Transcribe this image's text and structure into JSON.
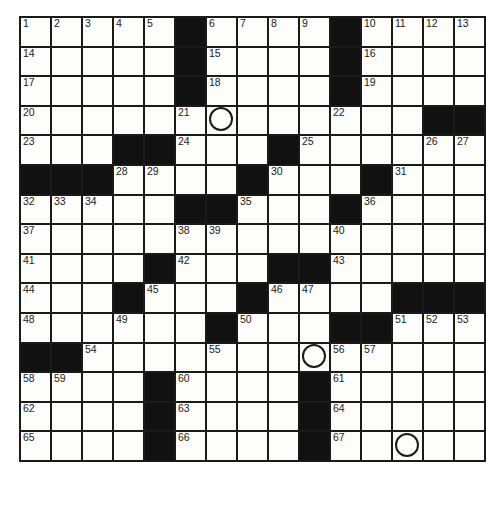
{
  "puzzle": {
    "title": "Crossword Puzzle Grid",
    "columns": 15,
    "rows": 16,
    "colors": {
      "block": "#111111",
      "cell": "#fdfdfb",
      "grid_line": "#1a1a1a",
      "number": "#1a1a1a",
      "circle": "#1a1a1a"
    },
    "legend": {
      "block_label": "blocked square",
      "circle_label": "circled square",
      "open_label": "open square"
    },
    "clue_numbers_present": [
      1,
      2,
      3,
      4,
      5,
      6,
      7,
      8,
      9,
      10,
      11,
      12,
      13,
      14,
      15,
      16,
      17,
      18,
      19,
      20,
      21,
      22,
      23,
      24,
      25,
      26,
      27,
      28,
      29,
      30,
      31,
      32,
      33,
      34,
      35,
      36,
      37,
      38,
      39,
      40,
      41,
      42,
      43,
      44,
      45,
      46,
      47,
      48,
      49,
      50,
      51,
      52,
      53,
      54,
      55,
      56,
      57,
      58,
      59,
      60,
      61,
      62,
      63,
      64,
      65,
      66,
      67
    ],
    "circled_cells": [
      {
        "row": 3,
        "col": 6
      },
      {
        "row": 12,
        "col": 9
      },
      {
        "row": 15,
        "col": 13
      }
    ],
    "grid": [
      [
        {
          "block": false,
          "num": "1"
        },
        {
          "block": false,
          "num": "2"
        },
        {
          "block": false,
          "num": "3"
        },
        {
          "block": false,
          "num": "4"
        },
        {
          "block": false,
          "num": "5"
        },
        {
          "block": true,
          "num": ""
        },
        {
          "block": false,
          "num": "6"
        },
        {
          "block": false,
          "num": "7"
        },
        {
          "block": false,
          "num": "8"
        },
        {
          "block": false,
          "num": "9"
        },
        {
          "block": true,
          "num": ""
        },
        {
          "block": false,
          "num": "10"
        },
        {
          "block": false,
          "num": "11"
        },
        {
          "block": false,
          "num": "12"
        },
        {
          "block": false,
          "num": "13"
        }
      ],
      [
        {
          "block": false,
          "num": "14"
        },
        {
          "block": false,
          "num": ""
        },
        {
          "block": false,
          "num": ""
        },
        {
          "block": false,
          "num": ""
        },
        {
          "block": false,
          "num": ""
        },
        {
          "block": true,
          "num": ""
        },
        {
          "block": false,
          "num": "15"
        },
        {
          "block": false,
          "num": ""
        },
        {
          "block": false,
          "num": ""
        },
        {
          "block": false,
          "num": ""
        },
        {
          "block": true,
          "num": ""
        },
        {
          "block": false,
          "num": "16"
        },
        {
          "block": false,
          "num": ""
        },
        {
          "block": false,
          "num": ""
        },
        {
          "block": false,
          "num": ""
        }
      ],
      [
        {
          "block": false,
          "num": "17"
        },
        {
          "block": false,
          "num": ""
        },
        {
          "block": false,
          "num": ""
        },
        {
          "block": false,
          "num": ""
        },
        {
          "block": false,
          "num": ""
        },
        {
          "block": true,
          "num": ""
        },
        {
          "block": false,
          "num": "18"
        },
        {
          "block": false,
          "num": ""
        },
        {
          "block": false,
          "num": ""
        },
        {
          "block": false,
          "num": ""
        },
        {
          "block": true,
          "num": ""
        },
        {
          "block": false,
          "num": "19"
        },
        {
          "block": false,
          "num": ""
        },
        {
          "block": false,
          "num": ""
        },
        {
          "block": false,
          "num": ""
        }
      ],
      [
        {
          "block": false,
          "num": "20"
        },
        {
          "block": false,
          "num": ""
        },
        {
          "block": false,
          "num": ""
        },
        {
          "block": false,
          "num": ""
        },
        {
          "block": false,
          "num": ""
        },
        {
          "block": false,
          "num": "21"
        },
        {
          "block": false,
          "num": "",
          "circle": true
        },
        {
          "block": false,
          "num": ""
        },
        {
          "block": false,
          "num": ""
        },
        {
          "block": false,
          "num": ""
        },
        {
          "block": false,
          "num": "22"
        },
        {
          "block": false,
          "num": ""
        },
        {
          "block": false,
          "num": ""
        },
        {
          "block": true,
          "num": ""
        },
        {
          "block": true,
          "num": ""
        }
      ],
      [
        {
          "block": false,
          "num": "23"
        },
        {
          "block": false,
          "num": ""
        },
        {
          "block": false,
          "num": ""
        },
        {
          "block": true,
          "num": ""
        },
        {
          "block": true,
          "num": ""
        },
        {
          "block": false,
          "num": "24"
        },
        {
          "block": false,
          "num": ""
        },
        {
          "block": false,
          "num": ""
        },
        {
          "block": true,
          "num": ""
        },
        {
          "block": false,
          "num": "25"
        },
        {
          "block": false,
          "num": ""
        },
        {
          "block": false,
          "num": ""
        },
        {
          "block": false,
          "num": ""
        },
        {
          "block": false,
          "num": "26"
        },
        {
          "block": false,
          "num": "27"
        }
      ],
      [
        {
          "block": true,
          "num": ""
        },
        {
          "block": true,
          "num": ""
        },
        {
          "block": true,
          "num": ""
        },
        {
          "block": false,
          "num": "28"
        },
        {
          "block": false,
          "num": "29"
        },
        {
          "block": false,
          "num": ""
        },
        {
          "block": false,
          "num": ""
        },
        {
          "block": true,
          "num": ""
        },
        {
          "block": false,
          "num": "30"
        },
        {
          "block": false,
          "num": ""
        },
        {
          "block": false,
          "num": ""
        },
        {
          "block": true,
          "num": ""
        },
        {
          "block": false,
          "num": "31"
        },
        {
          "block": false,
          "num": ""
        },
        {
          "block": false,
          "num": ""
        }
      ],
      [
        {
          "block": false,
          "num": "32"
        },
        {
          "block": false,
          "num": "33"
        },
        {
          "block": false,
          "num": "34"
        },
        {
          "block": false,
          "num": ""
        },
        {
          "block": false,
          "num": ""
        },
        {
          "block": true,
          "num": ""
        },
        {
          "block": true,
          "num": ""
        },
        {
          "block": false,
          "num": "35"
        },
        {
          "block": false,
          "num": ""
        },
        {
          "block": false,
          "num": ""
        },
        {
          "block": true,
          "num": ""
        },
        {
          "block": false,
          "num": "36"
        },
        {
          "block": false,
          "num": ""
        },
        {
          "block": false,
          "num": ""
        },
        {
          "block": false,
          "num": ""
        }
      ],
      [
        {
          "block": false,
          "num": "37"
        },
        {
          "block": false,
          "num": ""
        },
        {
          "block": false,
          "num": ""
        },
        {
          "block": false,
          "num": ""
        },
        {
          "block": false,
          "num": ""
        },
        {
          "block": false,
          "num": "38"
        },
        {
          "block": false,
          "num": "39"
        },
        {
          "block": false,
          "num": ""
        },
        {
          "block": false,
          "num": ""
        },
        {
          "block": false,
          "num": ""
        },
        {
          "block": false,
          "num": "40"
        },
        {
          "block": false,
          "num": ""
        },
        {
          "block": false,
          "num": ""
        },
        {
          "block": false,
          "num": ""
        },
        {
          "block": false,
          "num": ""
        }
      ],
      [
        {
          "block": false,
          "num": "41"
        },
        {
          "block": false,
          "num": ""
        },
        {
          "block": false,
          "num": ""
        },
        {
          "block": false,
          "num": ""
        },
        {
          "block": true,
          "num": ""
        },
        {
          "block": false,
          "num": "42"
        },
        {
          "block": false,
          "num": ""
        },
        {
          "block": false,
          "num": ""
        },
        {
          "block": true,
          "num": ""
        },
        {
          "block": true,
          "num": ""
        },
        {
          "block": false,
          "num": "43"
        },
        {
          "block": false,
          "num": ""
        },
        {
          "block": false,
          "num": ""
        },
        {
          "block": false,
          "num": ""
        },
        {
          "block": false,
          "num": ""
        }
      ],
      [
        {
          "block": false,
          "num": "44"
        },
        {
          "block": false,
          "num": ""
        },
        {
          "block": false,
          "num": ""
        },
        {
          "block": true,
          "num": ""
        },
        {
          "block": false,
          "num": "45"
        },
        {
          "block": false,
          "num": ""
        },
        {
          "block": false,
          "num": ""
        },
        {
          "block": true,
          "num": ""
        },
        {
          "block": false,
          "num": "46"
        },
        {
          "block": false,
          "num": "47"
        },
        {
          "block": false,
          "num": ""
        },
        {
          "block": false,
          "num": ""
        },
        {
          "block": true,
          "num": ""
        },
        {
          "block": true,
          "num": ""
        },
        {
          "block": true,
          "num": ""
        }
      ],
      [
        {
          "block": false,
          "num": "48"
        },
        {
          "block": false,
          "num": ""
        },
        {
          "block": false,
          "num": ""
        },
        {
          "block": false,
          "num": "49"
        },
        {
          "block": false,
          "num": ""
        },
        {
          "block": false,
          "num": ""
        },
        {
          "block": true,
          "num": ""
        },
        {
          "block": false,
          "num": "50"
        },
        {
          "block": false,
          "num": ""
        },
        {
          "block": false,
          "num": ""
        },
        {
          "block": true,
          "num": ""
        },
        {
          "block": true,
          "num": ""
        },
        {
          "block": false,
          "num": "51"
        },
        {
          "block": false,
          "num": "52"
        },
        {
          "block": false,
          "num": "53"
        }
      ],
      [
        {
          "block": true,
          "num": ""
        },
        {
          "block": true,
          "num": ""
        },
        {
          "block": false,
          "num": "54"
        },
        {
          "block": false,
          "num": ""
        },
        {
          "block": false,
          "num": ""
        },
        {
          "block": false,
          "num": ""
        },
        {
          "block": false,
          "num": "55"
        },
        {
          "block": false,
          "num": ""
        },
        {
          "block": false,
          "num": ""
        },
        {
          "block": false,
          "num": "",
          "circle": true
        },
        {
          "block": false,
          "num": "56"
        },
        {
          "block": false,
          "num": "57"
        },
        {
          "block": false,
          "num": ""
        },
        {
          "block": false,
          "num": ""
        },
        {
          "block": false,
          "num": ""
        }
      ],
      [
        {
          "block": false,
          "num": "58"
        },
        {
          "block": false,
          "num": "59"
        },
        {
          "block": false,
          "num": ""
        },
        {
          "block": false,
          "num": ""
        },
        {
          "block": true,
          "num": ""
        },
        {
          "block": false,
          "num": "60"
        },
        {
          "block": false,
          "num": ""
        },
        {
          "block": false,
          "num": ""
        },
        {
          "block": false,
          "num": ""
        },
        {
          "block": true,
          "num": ""
        },
        {
          "block": false,
          "num": "61"
        },
        {
          "block": false,
          "num": ""
        },
        {
          "block": false,
          "num": ""
        },
        {
          "block": false,
          "num": ""
        },
        {
          "block": false,
          "num": ""
        }
      ],
      [
        {
          "block": false,
          "num": "62"
        },
        {
          "block": false,
          "num": ""
        },
        {
          "block": false,
          "num": ""
        },
        {
          "block": false,
          "num": ""
        },
        {
          "block": true,
          "num": ""
        },
        {
          "block": false,
          "num": "63"
        },
        {
          "block": false,
          "num": ""
        },
        {
          "block": false,
          "num": ""
        },
        {
          "block": false,
          "num": ""
        },
        {
          "block": true,
          "num": ""
        },
        {
          "block": false,
          "num": "64"
        },
        {
          "block": false,
          "num": ""
        },
        {
          "block": false,
          "num": ""
        },
        {
          "block": false,
          "num": ""
        },
        {
          "block": false,
          "num": ""
        }
      ],
      [
        {
          "block": false,
          "num": "65"
        },
        {
          "block": false,
          "num": ""
        },
        {
          "block": false,
          "num": ""
        },
        {
          "block": false,
          "num": ""
        },
        {
          "block": true,
          "num": ""
        },
        {
          "block": false,
          "num": "66"
        },
        {
          "block": false,
          "num": ""
        },
        {
          "block": false,
          "num": ""
        },
        {
          "block": false,
          "num": ""
        },
        {
          "block": true,
          "num": ""
        },
        {
          "block": false,
          "num": "67"
        },
        {
          "block": false,
          "num": ""
        },
        {
          "block": false,
          "num": "",
          "circle": true
        },
        {
          "block": false,
          "num": ""
        },
        {
          "block": false,
          "num": ""
        }
      ]
    ]
  }
}
